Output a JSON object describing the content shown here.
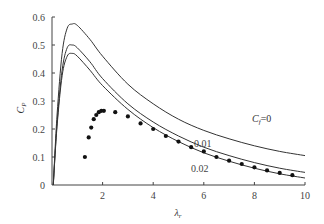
{
  "chart_data": {
    "type": "line",
    "title": "",
    "xlabel": "λr",
    "ylabel": "Cp",
    "xlim": [
      0,
      10
    ],
    "ylim": [
      0,
      0.6
    ],
    "x_ticks": [
      "2",
      "4",
      "6",
      "8",
      "10"
    ],
    "y_ticks": [
      "0",
      "0.1",
      "0.2",
      "0.3",
      "0.4",
      "0.5",
      "0.6"
    ],
    "grid": false,
    "series": [
      {
        "name": "Cf=0",
        "label": "Cf=0",
        "style": "line",
        "x": [
          0.05,
          0.2,
          0.4,
          0.6,
          0.8,
          1.0,
          1.5,
          2,
          3,
          4,
          5,
          6,
          7,
          8,
          9,
          10
        ],
        "y": [
          0.0,
          0.25,
          0.47,
          0.56,
          0.575,
          0.57,
          0.52,
          0.46,
          0.36,
          0.29,
          0.235,
          0.195,
          0.165,
          0.14,
          0.12,
          0.105
        ]
      },
      {
        "name": "Cf=0.01",
        "label": "0.01",
        "style": "line",
        "x": [
          0.05,
          0.2,
          0.4,
          0.6,
          0.8,
          1.0,
          1.5,
          2,
          3,
          4,
          5,
          6,
          7,
          8,
          9,
          10
        ],
        "y": [
          0.0,
          0.22,
          0.41,
          0.49,
          0.5,
          0.49,
          0.44,
          0.38,
          0.29,
          0.225,
          0.175,
          0.135,
          0.105,
          0.08,
          0.06,
          0.045
        ]
      },
      {
        "name": "Cf=0.02",
        "label": "0.02",
        "style": "line",
        "x": [
          0.05,
          0.2,
          0.4,
          0.6,
          0.8,
          1.0,
          1.5,
          2,
          3,
          4,
          5,
          6,
          7,
          8,
          9,
          10
        ],
        "y": [
          0.0,
          0.21,
          0.39,
          0.46,
          0.47,
          0.46,
          0.41,
          0.355,
          0.27,
          0.205,
          0.155,
          0.115,
          0.085,
          0.06,
          0.04,
          0.025
        ]
      },
      {
        "name": "data points",
        "style": "scatter",
        "x": [
          1.3,
          1.45,
          1.55,
          1.65,
          1.75,
          1.85,
          1.95,
          2.05,
          2.5,
          3.0,
          3.5,
          4.0,
          4.5,
          5.0,
          5.5,
          6.0,
          6.5,
          7.0,
          7.5,
          8.0,
          8.5,
          9.0,
          9.5
        ],
        "y": [
          0.1,
          0.17,
          0.205,
          0.235,
          0.25,
          0.26,
          0.265,
          0.265,
          0.26,
          0.245,
          0.22,
          0.2,
          0.175,
          0.155,
          0.135,
          0.12,
          0.1,
          0.087,
          0.075,
          0.063,
          0.052,
          0.043,
          0.035
        ]
      }
    ],
    "annotations": [
      "Cf=0",
      "0.01",
      "0.02"
    ]
  },
  "labels": {
    "ylabel_main": "C",
    "ylabel_sub": "P",
    "xlabel_main": "λ",
    "xlabel_sub": "r",
    "cf0_main": "C",
    "cf0_sub": "f",
    "cf0_val": "=0",
    "cf001": "0.01",
    "cf002": "0.02"
  },
  "colors": {
    "line": "#333333",
    "dot": "#111111",
    "axis": "#444444"
  }
}
